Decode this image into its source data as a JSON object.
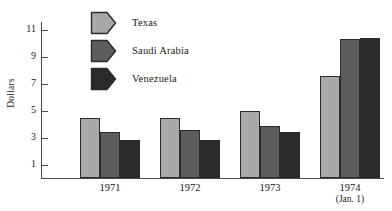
{
  "chart_data": {
    "type": "bar",
    "title": "",
    "xlabel": "",
    "ylabel": "Dollars",
    "categories": [
      "1971",
      "1972",
      "1973",
      "1974"
    ],
    "category_sublabels": [
      "",
      "",
      "",
      "(Jan. 1)"
    ],
    "series": [
      {
        "name": "Texas",
        "values": [
          4.5,
          4.5,
          5.0,
          7.6
        ],
        "color": "#a9a9a9"
      },
      {
        "name": "Saudi Arabia",
        "values": [
          3.45,
          3.6,
          3.85,
          10.35
        ],
        "color": "#5d5d5d"
      },
      {
        "name": "Venezuela",
        "values": [
          2.85,
          2.85,
          3.4,
          10.45
        ],
        "color": "#2a2a2a"
      }
    ],
    "yticks": [
      1,
      3,
      5,
      7,
      9,
      11
    ],
    "ytick_labels": [
      "1",
      "3",
      "5",
      "7",
      "9",
      "11"
    ],
    "ylim": [
      0,
      11.6
    ],
    "grid": false,
    "legend_position": "top-left-inside"
  },
  "axis": {
    "y_title": "Dollars"
  },
  "legend": {
    "items": [
      {
        "label": "Texas"
      },
      {
        "label": "Saudi Arabia"
      },
      {
        "label": "Venezuela"
      }
    ]
  }
}
